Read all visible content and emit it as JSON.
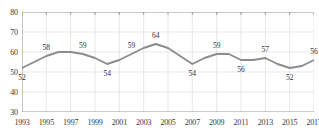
{
  "chart_data": {
    "type": "line",
    "title": "",
    "subtitle": "",
    "xlabel": "",
    "ylabel": "",
    "grid": true,
    "legend": false,
    "legend_position": "none",
    "line_color": "#8c8c8c",
    "axis_color": "#8a8a8a",
    "grid_color": "#d9d9d9",
    "label_color": "#2e2e2e",
    "xlim": [
      1993,
      2017
    ],
    "ylim": [
      30,
      80
    ],
    "y_ticks": [
      30,
      40,
      50,
      60,
      70,
      80
    ],
    "y_tick_labels": [
      "30",
      "40",
      "50",
      "60",
      "70",
      "80"
    ],
    "x_ticks": [
      1993,
      1995,
      1997,
      1999,
      2001,
      2003,
      2005,
      2007,
      2009,
      2011,
      2013,
      2015,
      2017
    ],
    "x_tick_labels": [
      "1993",
      "1995",
      "1997",
      "1999",
      "2001",
      "2003",
      "2005",
      "2007",
      "2009",
      "2011",
      "2013",
      "2015",
      "2017"
    ],
    "x": [
      1993,
      1994,
      1995,
      1996,
      1997,
      1998,
      1999,
      2000,
      2001,
      2002,
      2003,
      2004,
      2005,
      2006,
      2007,
      2008,
      2009,
      2010,
      2011,
      2012,
      2013,
      2014,
      2015,
      2016,
      2017
    ],
    "values": [
      52,
      55,
      58,
      60,
      60,
      59,
      57,
      54,
      56,
      59,
      62,
      64,
      62,
      58,
      54,
      57,
      59,
      59,
      56,
      56,
      57,
      54,
      52,
      53,
      56
    ],
    "point_labels": [
      {
        "x": 1993,
        "value": 52,
        "text": "52",
        "position": "below"
      },
      {
        "x": 1995,
        "value": 58,
        "text": "58",
        "position": "above"
      },
      {
        "x": 1998,
        "value": 59,
        "text": "59",
        "position": "above"
      },
      {
        "x": 2000,
        "value": 54,
        "text": "54",
        "position": "below"
      },
      {
        "x": 2002,
        "value": 59,
        "text": "59",
        "position": "above"
      },
      {
        "x": 2004,
        "value": 64,
        "text": "64",
        "position": "above"
      },
      {
        "x": 2007,
        "value": 54,
        "text": "54",
        "position": "below"
      },
      {
        "x": 2009,
        "value": 59,
        "text": "59",
        "position": "above"
      },
      {
        "x": 2011,
        "value": 56,
        "text": "56",
        "position": "below"
      },
      {
        "x": 2013,
        "value": 57,
        "text": "57",
        "position": "above"
      },
      {
        "x": 2015,
        "value": 52,
        "text": "52",
        "position": "below"
      },
      {
        "x": 2017,
        "value": 56,
        "text": "56",
        "position": "above"
      }
    ]
  }
}
